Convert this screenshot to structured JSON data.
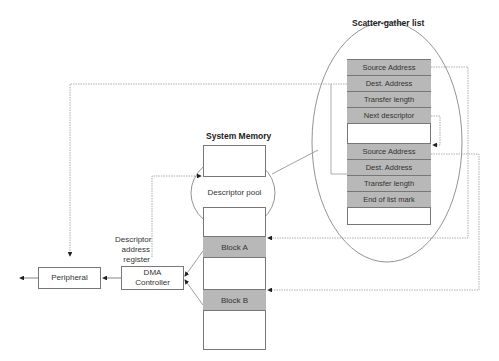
{
  "scatter_gather": {
    "title": "Scatter-gather list",
    "descriptors": [
      {
        "rows": [
          "Source Address",
          "Dest. Address",
          "Transfer length",
          "Next descriptor"
        ]
      },
      {
        "rows": [
          "Source Address",
          "Dest. Address",
          "Transfer length",
          "End of list mark"
        ]
      }
    ]
  },
  "system_memory": {
    "title": "System Memory",
    "descriptor_pool": "Descriptor pool",
    "block_a": "Block A",
    "block_b": "Block B"
  },
  "dma": {
    "controller_line1": "DMA",
    "controller_line2": "Controller",
    "register_line1": "Descriptor",
    "register_line2": "address",
    "register_line3": "register"
  },
  "peripheral": {
    "label": "Peripheral"
  },
  "colors": {
    "shaded_row": "#b8b8b8",
    "border": "#777777",
    "line": "#888888"
  }
}
